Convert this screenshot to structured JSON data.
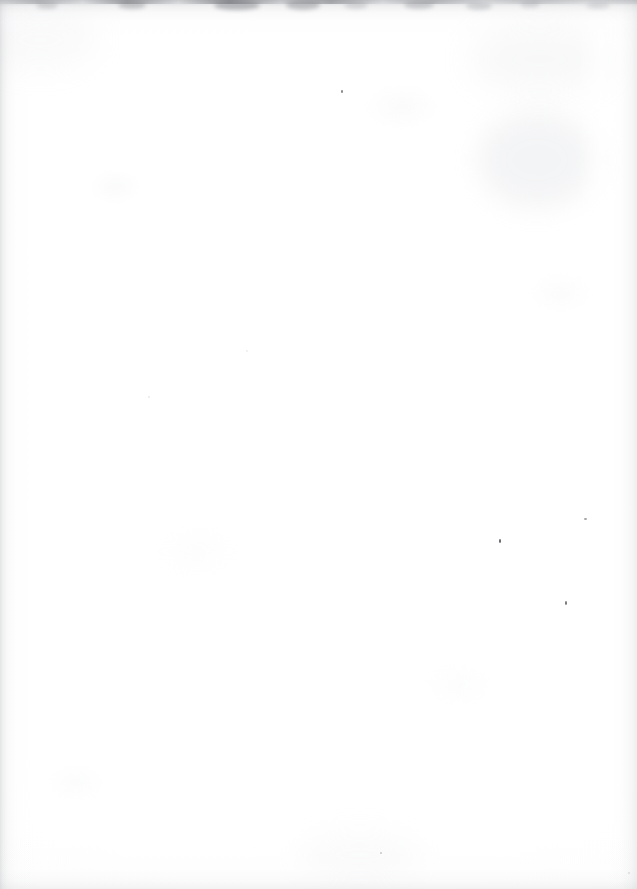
{
  "page": {
    "kind": "scanned-blank-page",
    "width": 637,
    "height": 889,
    "visible_text": "",
    "paper_color": "#fefefe",
    "edge_shadow_color": "#84868b",
    "stain_color": "#c9ccd1",
    "speck_color": "#5a5c61"
  },
  "top_edge": {
    "name": "torn-top-edge",
    "height": 40,
    "smudges": [
      {
        "x": 36,
        "y": 2,
        "w": 22,
        "h": 7,
        "opacity": 0.38,
        "color": "#9a9ca1"
      },
      {
        "x": 118,
        "y": 1,
        "w": 28,
        "h": 8,
        "opacity": 0.44,
        "color": "#8c8e93"
      },
      {
        "x": 214,
        "y": 1,
        "w": 46,
        "h": 9,
        "opacity": 0.5,
        "color": "#7e8085"
      },
      {
        "x": 286,
        "y": 0,
        "w": 34,
        "h": 10,
        "opacity": 0.46,
        "color": "#86888d"
      },
      {
        "x": 344,
        "y": 2,
        "w": 24,
        "h": 7,
        "opacity": 0.34,
        "color": "#9a9ca1"
      },
      {
        "x": 404,
        "y": 1,
        "w": 30,
        "h": 8,
        "opacity": 0.4,
        "color": "#8e9095"
      },
      {
        "x": 466,
        "y": 2,
        "w": 26,
        "h": 8,
        "opacity": 0.36,
        "color": "#969a9f"
      },
      {
        "x": 520,
        "y": 1,
        "w": 20,
        "h": 7,
        "opacity": 0.32,
        "color": "#a0a2a7"
      },
      {
        "x": 586,
        "y": 2,
        "w": 24,
        "h": 7,
        "opacity": 0.3,
        "color": "#a4a6ab"
      }
    ]
  },
  "stains": [
    {
      "name": "foxing-stain-upper-right",
      "x": 478,
      "y": 112,
      "w": 118,
      "h": 96,
      "color": "#cdd0d5",
      "opacity": 0.22,
      "blur": 13
    },
    {
      "name": "foxing-stain-top-right-corner",
      "x": 470,
      "y": 24,
      "w": 140,
      "h": 70,
      "color": "#d6d8dc",
      "opacity": 0.16,
      "blur": 16
    },
    {
      "name": "shadow-top-left",
      "x": -20,
      "y": 10,
      "w": 120,
      "h": 60,
      "color": "#dcdee1",
      "opacity": 0.14,
      "blur": 15
    },
    {
      "name": "smudge-bottom-center",
      "x": 300,
      "y": 830,
      "w": 120,
      "h": 50,
      "color": "#e0e2e5",
      "opacity": 0.12,
      "blur": 13
    }
  ],
  "specks": [
    {
      "name": "speck-upper-center",
      "x": 341,
      "y": 90,
      "w": 2,
      "h": 3,
      "color": "#5e6065",
      "opacity": 0.72
    },
    {
      "name": "speck-right-upper",
      "x": 584,
      "y": 518,
      "w": 3,
      "h": 2,
      "color": "#6a6c71",
      "opacity": 0.62
    },
    {
      "name": "speck-center-right",
      "x": 499,
      "y": 539,
      "w": 2,
      "h": 4,
      "color": "#45474c",
      "opacity": 0.8
    },
    {
      "name": "speck-lower-right",
      "x": 565,
      "y": 601,
      "w": 2,
      "h": 4,
      "color": "#4e5055",
      "opacity": 0.74
    },
    {
      "name": "speck-bottom-center",
      "x": 380,
      "y": 852,
      "w": 2,
      "h": 2,
      "color": "#8a8c91",
      "opacity": 0.46
    },
    {
      "name": "speck-left-mid",
      "x": 148,
      "y": 396,
      "w": 2,
      "h": 2,
      "color": "#b4b6ba",
      "opacity": 0.3
    },
    {
      "name": "speck-mid-page",
      "x": 246,
      "y": 350,
      "w": 2,
      "h": 2,
      "color": "#bcbec2",
      "opacity": 0.26
    },
    {
      "name": "speck-right-low",
      "x": 628,
      "y": 872,
      "w": 2,
      "h": 2,
      "color": "#a8aaae",
      "opacity": 0.34
    }
  ]
}
